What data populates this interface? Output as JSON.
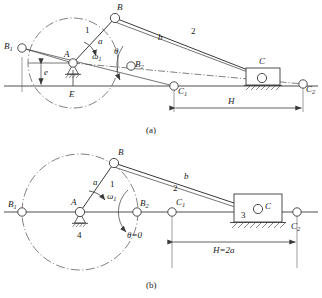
{
  "figure": {
    "title_caption_a": "(a)",
    "title_caption_b": "(b)",
    "type": "kinematic-mechanism-diagram"
  },
  "colors": {
    "line": "#3a3a3a",
    "centerline": "#4a4a4a",
    "joint_fill": "#ffffff",
    "text": "#1a1a1a",
    "background": "#ffffff"
  },
  "diagram_a": {
    "caption": "(a)",
    "joints": [
      {
        "name": "B1",
        "base": "B",
        "sub": "1",
        "x": 22,
        "y": 48
      },
      {
        "name": "A",
        "base": "A",
        "sub": "",
        "x": 73,
        "y": 63
      },
      {
        "name": "B",
        "base": "B",
        "sub": "",
        "x": 115,
        "y": 18
      },
      {
        "name": "B2",
        "base": "B",
        "sub": "2",
        "x": 131,
        "y": 66
      },
      {
        "name": "C1",
        "base": "C",
        "sub": "1",
        "x": 174,
        "y": 86
      },
      {
        "name": "C",
        "base": "C",
        "sub": "",
        "x": 262,
        "y": 83
      },
      {
        "name": "C2",
        "base": "C",
        "sub": "2",
        "x": 303,
        "y": 84
      },
      {
        "name": "E",
        "base": "E",
        "sub": "",
        "x": 73,
        "y": 86
      }
    ],
    "labels": [
      {
        "text": "a",
        "kind": "link-length",
        "x": 100,
        "y": 43
      },
      {
        "text": "1",
        "kind": "link-number",
        "x": 87,
        "y": 32
      },
      {
        "text": "b",
        "kind": "link-length",
        "x": 160,
        "y": 38
      },
      {
        "text": "2",
        "kind": "link-number",
        "x": 192,
        "y": 33
      },
      {
        "text": "e",
        "kind": "offset",
        "x": 46,
        "y": 72
      },
      {
        "text": "H",
        "kind": "stroke",
        "x": 228,
        "y": 104
      },
      {
        "text": "θ",
        "kind": "angle",
        "x": 114,
        "y": 53
      },
      {
        "text": "ω",
        "sub": "1",
        "kind": "angular-velocity",
        "x": 95,
        "y": 57
      }
    ]
  },
  "diagram_b": {
    "caption": "(b)",
    "joints": [
      {
        "name": "B1",
        "base": "B",
        "sub": "1",
        "x": 22,
        "y": 212
      },
      {
        "name": "A",
        "base": "A",
        "sub": "",
        "x": 80,
        "y": 212
      },
      {
        "name": "B",
        "base": "B",
        "sub": "",
        "x": 114,
        "y": 163
      },
      {
        "name": "B2",
        "base": "B",
        "sub": "2",
        "x": 137,
        "y": 212
      },
      {
        "name": "C1",
        "base": "C",
        "sub": "1",
        "x": 172,
        "y": 212
      },
      {
        "name": "C",
        "base": "C",
        "sub": "",
        "x": 258,
        "y": 212
      },
      {
        "name": "C2",
        "base": "C",
        "sub": "2",
        "x": 297,
        "y": 212
      }
    ],
    "labels": [
      {
        "text": "a",
        "kind": "link-length",
        "x": 96,
        "y": 184
      },
      {
        "text": "1",
        "kind": "link-number",
        "x": 111,
        "y": 186
      },
      {
        "text": "b",
        "kind": "link-length",
        "x": 186,
        "y": 178
      },
      {
        "text": "2",
        "kind": "link-number",
        "x": 175,
        "y": 190
      },
      {
        "text": "3",
        "kind": "link-number",
        "x": 243,
        "y": 223
      },
      {
        "text": "4",
        "kind": "link-number",
        "x": 80,
        "y": 237
      },
      {
        "text": "H=2a",
        "kind": "stroke",
        "x": 220,
        "y": 253
      },
      {
        "text": "θ=0",
        "kind": "angle",
        "x": 131,
        "y": 236
      },
      {
        "text": "ω",
        "sub": "1",
        "kind": "angular-velocity",
        "x": 110,
        "y": 198
      }
    ]
  },
  "annotations": {
    "crank_length": "a",
    "coupler_length": "b",
    "offset": "e",
    "stroke_a": "H",
    "stroke_b": "H=2a",
    "crank_angle": "θ",
    "crank_angle_b": "θ=0",
    "angular_velocity": "ω",
    "angular_velocity_sub": "1",
    "link_crank": "1",
    "link_coupler": "2",
    "link_slider": "3",
    "link_frame": "4"
  }
}
